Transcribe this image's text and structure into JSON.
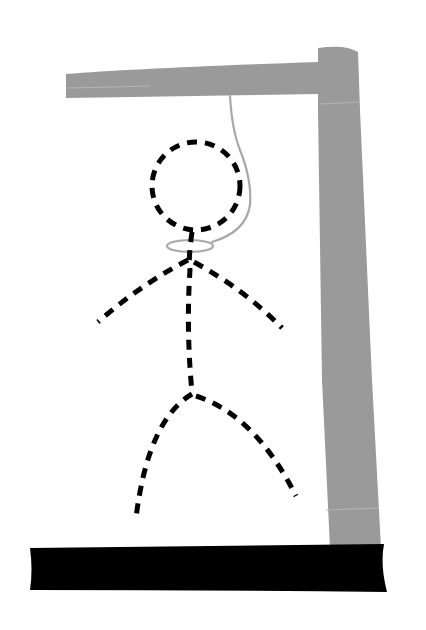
{
  "scene": {
    "title": "Hangman",
    "width": 426,
    "height": 630
  },
  "colors": {
    "background": "#ffffff",
    "gallows": "#9a9a9a",
    "gallows_highlight": "#b5b5b5",
    "base": "#000000",
    "rope": "#a8a8a8",
    "figure": "#000000"
  },
  "gallows": {
    "beam": "M66,74 Q140,68 318,62 L318,94 Q200,96 66,98 Z",
    "post": "M318,48 Q345,44 358,52 L360,110 L372,380 L381,548 L330,548 L322,380 L318,110 Z",
    "base": "M30,548 L384,544 Q380,565 387,592 Q200,590 30,590 Q33,570 30,548 Z",
    "seams": [
      "M68,88 L150,86",
      "M320,104 L360,102",
      "M326,510 L378,508"
    ]
  },
  "rope": {
    "line": "M230,96 Q232,130 240,150 Q252,180 250,205 Q246,232 212,242",
    "noose": {
      "cx": 190,
      "cy": 246,
      "rx": 23,
      "ry": 6
    }
  },
  "figure": {
    "parts": [
      {
        "name": "head",
        "type": "circle",
        "cx": 196,
        "cy": 186,
        "r": 44
      },
      {
        "name": "torso",
        "type": "path",
        "d": "M192,232 Q188,260 190,270 Q186,330 192,392"
      },
      {
        "name": "left-arm",
        "type": "path",
        "d": "M188,260 Q140,285 98,322"
      },
      {
        "name": "right-arm",
        "type": "path",
        "d": "M194,262 Q245,290 282,328"
      },
      {
        "name": "left-leg",
        "type": "path",
        "d": "M192,394 Q148,420 136,518"
      },
      {
        "name": "right-leg",
        "type": "path",
        "d": "M196,396 Q255,415 296,496"
      }
    ],
    "stroke_width": 5,
    "dash": "10 8"
  }
}
